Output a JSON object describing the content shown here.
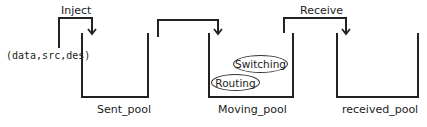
{
  "diagram": {
    "input_label": "(data,src,des)",
    "arrows": [
      {
        "label": "Inject"
      },
      {
        "label": ""
      },
      {
        "label": "Receive"
      }
    ],
    "pools": [
      {
        "label": "Sent_pool"
      },
      {
        "label": "Moving_pool"
      },
      {
        "label": "received_pool"
      }
    ],
    "processes": [
      {
        "label": "Switching"
      },
      {
        "label": "Routing"
      }
    ]
  }
}
